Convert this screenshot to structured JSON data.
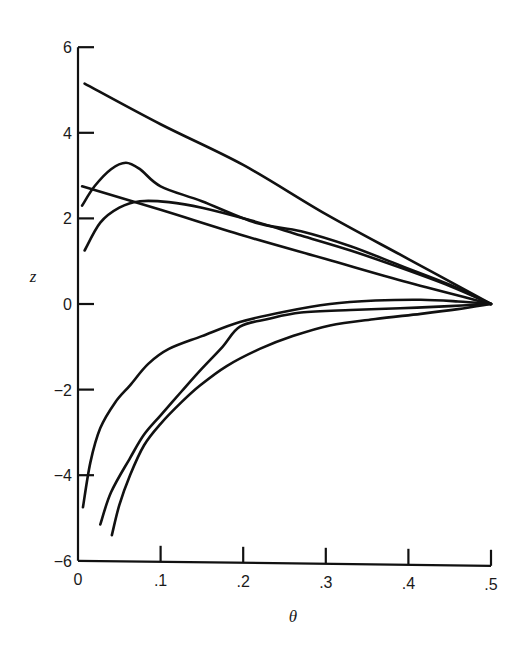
{
  "chart_data": {
    "type": "line",
    "title": "",
    "xlabel": "θ",
    "ylabel": "z",
    "xlim": [
      0,
      0.5
    ],
    "ylim": [
      -6,
      6
    ],
    "grid": false,
    "legend": null,
    "x_ticks": [
      {
        "value": 0,
        "label": "0"
      },
      {
        "value": 0.1,
        "label": ".1"
      },
      {
        "value": 0.2,
        "label": ".2"
      },
      {
        "value": 0.3,
        "label": ".3"
      },
      {
        "value": 0.4,
        "label": ".4"
      },
      {
        "value": 0.5,
        "label": ".5"
      }
    ],
    "y_ticks": [
      {
        "value": 6,
        "label": "6"
      },
      {
        "value": 4,
        "label": "4"
      },
      {
        "value": 2,
        "label": "2"
      },
      {
        "value": 0,
        "label": "0"
      },
      {
        "value": -2,
        "label": "−2"
      },
      {
        "value": -4,
        "label": "−4"
      },
      {
        "value": -6,
        "label": "−6"
      }
    ],
    "series": [
      {
        "name": "curve-1-upper-straight",
        "points": [
          [
            0.008,
            5.15
          ],
          [
            0.1,
            4.2
          ],
          [
            0.2,
            3.25
          ],
          [
            0.3,
            2.1
          ],
          [
            0.4,
            1.05
          ],
          [
            0.5,
            0
          ]
        ]
      },
      {
        "name": "curve-2-peaked",
        "points": [
          [
            0.005,
            2.3
          ],
          [
            0.02,
            2.75
          ],
          [
            0.04,
            3.15
          ],
          [
            0.058,
            3.3
          ],
          [
            0.075,
            3.15
          ],
          [
            0.1,
            2.75
          ],
          [
            0.15,
            2.4
          ],
          [
            0.215,
            1.9
          ],
          [
            0.27,
            1.7
          ],
          [
            0.33,
            1.35
          ],
          [
            0.39,
            0.9
          ],
          [
            0.45,
            0.45
          ],
          [
            0.5,
            0
          ]
        ]
      },
      {
        "name": "curve-3-straight",
        "points": [
          [
            0.005,
            2.75
          ],
          [
            0.1,
            2.2
          ],
          [
            0.2,
            1.6
          ],
          [
            0.3,
            1.05
          ],
          [
            0.4,
            0.5
          ],
          [
            0.5,
            0
          ]
        ]
      },
      {
        "name": "curve-4-low-hump",
        "points": [
          [
            0.008,
            1.25
          ],
          [
            0.027,
            1.9
          ],
          [
            0.05,
            2.25
          ],
          [
            0.075,
            2.4
          ],
          [
            0.11,
            2.38
          ],
          [
            0.15,
            2.25
          ],
          [
            0.21,
            1.95
          ],
          [
            0.27,
            1.6
          ],
          [
            0.33,
            1.25
          ],
          [
            0.39,
            0.85
          ],
          [
            0.45,
            0.42
          ],
          [
            0.5,
            0
          ]
        ]
      },
      {
        "name": "curve-5-negative-a",
        "points": [
          [
            0.006,
            -4.75
          ],
          [
            0.015,
            -3.7
          ],
          [
            0.027,
            -2.9
          ],
          [
            0.045,
            -2.3
          ],
          [
            0.063,
            -1.9
          ],
          [
            0.085,
            -1.4
          ],
          [
            0.11,
            -1.05
          ],
          [
            0.15,
            -0.75
          ],
          [
            0.196,
            -0.42
          ],
          [
            0.25,
            -0.18
          ],
          [
            0.305,
            0.0
          ],
          [
            0.36,
            0.08
          ],
          [
            0.415,
            0.1
          ],
          [
            0.46,
            0.06
          ],
          [
            0.5,
            0
          ]
        ]
      },
      {
        "name": "curve-6-negative-b",
        "points": [
          [
            0.027,
            -5.15
          ],
          [
            0.04,
            -4.4
          ],
          [
            0.063,
            -3.6
          ],
          [
            0.08,
            -3.05
          ],
          [
            0.1,
            -2.6
          ],
          [
            0.125,
            -2.05
          ],
          [
            0.148,
            -1.55
          ],
          [
            0.175,
            -1.0
          ],
          [
            0.196,
            -0.53
          ],
          [
            0.23,
            -0.35
          ],
          [
            0.27,
            -0.2
          ],
          [
            0.33,
            -0.14
          ],
          [
            0.39,
            -0.1
          ],
          [
            0.45,
            -0.05
          ],
          [
            0.5,
            0
          ]
        ]
      },
      {
        "name": "curve-7-negative-c",
        "points": [
          [
            0.041,
            -5.4
          ],
          [
            0.05,
            -4.7
          ],
          [
            0.063,
            -4.0
          ],
          [
            0.08,
            -3.3
          ],
          [
            0.1,
            -2.8
          ],
          [
            0.125,
            -2.3
          ],
          [
            0.148,
            -1.9
          ],
          [
            0.18,
            -1.45
          ],
          [
            0.22,
            -1.05
          ],
          [
            0.26,
            -0.75
          ],
          [
            0.305,
            -0.5
          ],
          [
            0.36,
            -0.35
          ],
          [
            0.415,
            -0.23
          ],
          [
            0.46,
            -0.12
          ],
          [
            0.5,
            0
          ]
        ]
      }
    ]
  }
}
